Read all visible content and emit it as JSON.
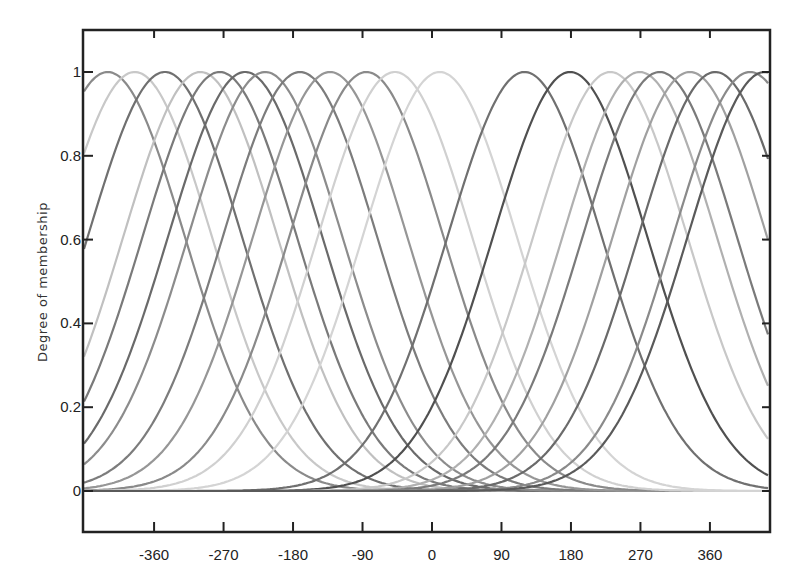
{
  "chart_data": {
    "type": "line",
    "title": "",
    "xlabel": "",
    "ylabel": "Degree of membership",
    "xlim": [
      -448,
      438
    ],
    "ylim": [
      -0.1,
      1.1
    ],
    "grid": false,
    "legend": "none",
    "x_ticks": [
      -360,
      -270,
      -180,
      -90,
      0,
      90,
      180,
      270,
      360
    ],
    "x_tick_labels": [
      "-360",
      "-270",
      "-180",
      "-90",
      "0",
      "90",
      "180",
      "270",
      "360"
    ],
    "y_ticks": [
      0,
      0.2,
      0.4,
      0.6,
      0.8,
      1
    ],
    "y_tick_labels": [
      "0",
      "0.2",
      "0.4",
      "0.6",
      "0.8",
      "1"
    ],
    "curve_shape": "gaussian",
    "sigma": 100,
    "series": [
      {
        "name": "mf1",
        "center": -420,
        "shade": "#8a8a8a"
      },
      {
        "name": "mf2",
        "center": -385,
        "shade": "#c8c8c8"
      },
      {
        "name": "mf3",
        "center": -346,
        "shade": "#707070"
      },
      {
        "name": "mf4",
        "center": -300,
        "shade": "#c0c0c0"
      },
      {
        "name": "mf5",
        "center": -275,
        "shade": "#7a7a7a"
      },
      {
        "name": "mf6",
        "center": -242,
        "shade": "#6a6a6a"
      },
      {
        "name": "mf7",
        "center": -216,
        "shade": "#8c8c8c"
      },
      {
        "name": "mf8",
        "center": -171,
        "shade": "#7c7c7c"
      },
      {
        "name": "mf9",
        "center": -132,
        "shade": "#969696"
      },
      {
        "name": "mf10",
        "center": -85,
        "shade": "#8a8a8a"
      },
      {
        "name": "mf11",
        "center": -48,
        "shade": "#d0d0d0"
      },
      {
        "name": "mf12",
        "center": 10,
        "shade": "#d4d4d4"
      },
      {
        "name": "mf13",
        "center": 120,
        "shade": "#707070"
      },
      {
        "name": "mf14",
        "center": 179,
        "shade": "#505050"
      },
      {
        "name": "mf15",
        "center": 231,
        "shade": "#c8c8c8"
      },
      {
        "name": "mf16",
        "center": 269,
        "shade": "#b0b0b0"
      },
      {
        "name": "mf17",
        "center": 295,
        "shade": "#7a7a7a"
      },
      {
        "name": "mf18",
        "center": 334,
        "shade": "#a0a0a0"
      },
      {
        "name": "mf19",
        "center": 367,
        "shade": "#6a6a6a"
      },
      {
        "name": "mf20",
        "center": 412,
        "shade": "#8a8a8a"
      },
      {
        "name": "mf21",
        "center": 431,
        "shade": "#5a5a5a"
      }
    ]
  },
  "layout": {
    "plot": {
      "left": 83,
      "top": 30,
      "right": 770,
      "bottom": 532
    },
    "x_px_per_unit": 0.772,
    "x_zero_px": 432,
    "y_one_px": 72,
    "y_zero_px": 491
  }
}
